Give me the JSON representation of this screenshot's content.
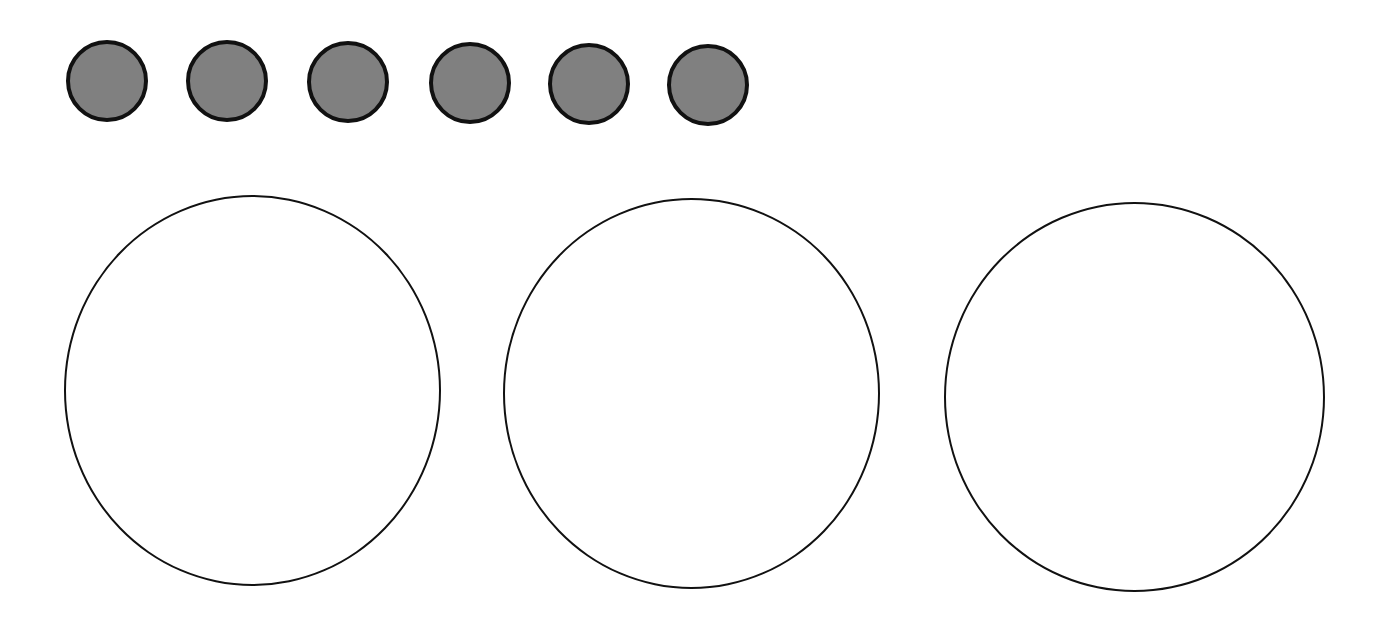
{
  "diagram": {
    "background_color": "#ffffff",
    "small_circles": {
      "count": 6,
      "fill_color": "#808080",
      "stroke_color": "#111111",
      "items": [
        {
          "x": 66,
          "y": 40,
          "d": 82
        },
        {
          "x": 186,
          "y": 40,
          "d": 82
        },
        {
          "x": 307,
          "y": 41,
          "d": 82
        },
        {
          "x": 429,
          "y": 42,
          "d": 82
        },
        {
          "x": 548,
          "y": 43,
          "d": 82
        },
        {
          "x": 667,
          "y": 44,
          "d": 82
        }
      ]
    },
    "large_circles": {
      "count": 3,
      "fill_color": "#ffffff",
      "stroke_color": "#111111",
      "items": [
        {
          "x": 64,
          "y": 195,
          "w": 377,
          "h": 391
        },
        {
          "x": 503,
          "y": 198,
          "w": 377,
          "h": 391
        },
        {
          "x": 944,
          "y": 202,
          "w": 381,
          "h": 390
        }
      ]
    }
  }
}
